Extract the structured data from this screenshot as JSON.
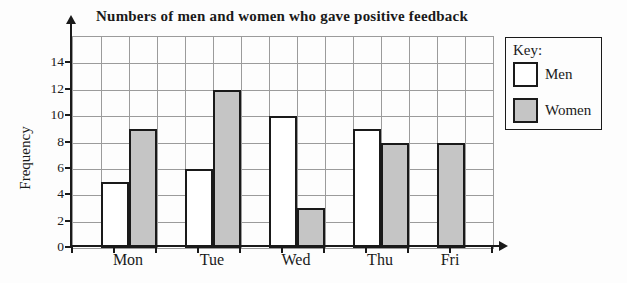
{
  "title": "Numbers of men and women who gave positive feedback",
  "key": {
    "label": "Key:",
    "entries": [
      {
        "label": "Men",
        "color": "#ffffff"
      },
      {
        "label": "Women",
        "color": "#c5c5c5"
      }
    ]
  },
  "chart_data": {
    "type": "bar",
    "categories": [
      "Mon",
      "Tue",
      "Wed",
      "Thu",
      "Fri"
    ],
    "series": [
      {
        "name": "Men",
        "values": [
          5,
          6,
          10,
          9,
          0
        ]
      },
      {
        "name": "Women",
        "values": [
          9,
          12,
          3,
          8,
          8
        ]
      }
    ],
    "title": "Numbers of men and women who gave positive feedback",
    "xlabel": "",
    "ylabel": "Frequency",
    "ylim": [
      0,
      16
    ],
    "yticks": [
      0,
      2,
      4,
      6,
      8,
      10,
      12,
      14
    ],
    "ytick_step": 2,
    "grid": true,
    "legend_position": "right",
    "legend_title": "Key:",
    "colors": {
      "men_fill": "#ffffff",
      "women_fill": "#c5c5c5",
      "grid": "#9b9b9b",
      "axis": "#1a1a1a"
    }
  }
}
